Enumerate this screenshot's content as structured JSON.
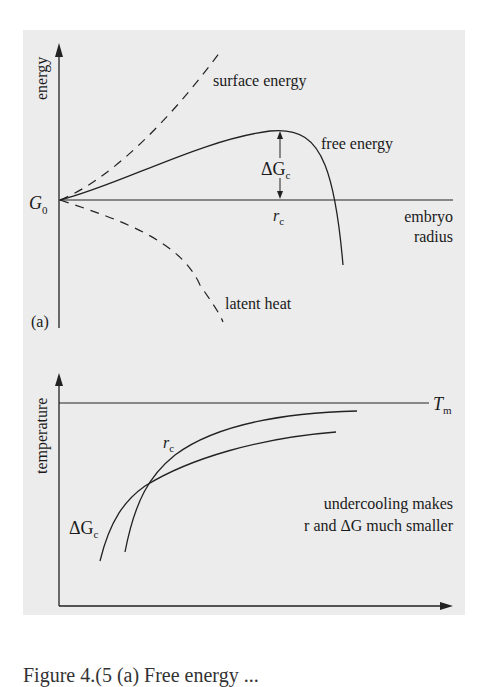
{
  "panel_a": {
    "label": "(a)",
    "y_axis_label": "energy",
    "origin_label": "G",
    "origin_sub": "0",
    "x_axis_label_line1": "embryo",
    "x_axis_label_line2": "radius",
    "curves": {
      "surface_energy": "surface energy",
      "free_energy": "free energy",
      "latent_heat": "latent heat"
    },
    "delta_g_label": "ΔG",
    "delta_g_sub": "c",
    "rc_label": "r",
    "rc_sub": "c"
  },
  "panel_b": {
    "label": "(b)",
    "y_axis_label": "temperature",
    "tm_label": "T",
    "tm_sub": "m",
    "rc_label": "r",
    "rc_sub": "c",
    "delta_g_label": "ΔG",
    "delta_g_sub": "c",
    "note_line1": "undercooling makes",
    "note_line2": "r  and ΔG  much smaller"
  },
  "caption": "Figure 4.(5 (a)  Free energy ... "
}
